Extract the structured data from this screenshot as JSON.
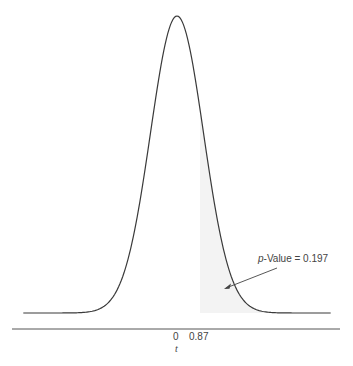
{
  "chart_data": {
    "type": "area",
    "title": "",
    "xlabel": "t",
    "ylabel": "",
    "distribution": "t (symmetric, bell-shaped density)",
    "x_ticks": [
      {
        "value": 0,
        "label": "0"
      },
      {
        "value": 0.87,
        "label": "0.87"
      }
    ],
    "shaded_region": {
      "from": 0.87,
      "to": "inf",
      "tail": "right"
    },
    "annotation": {
      "prefix": "p",
      "text": "-Value = 0.197",
      "p_value": 0.197
    },
    "xlim": [
      -5.8,
      5.8
    ],
    "grid": false,
    "legend": null
  },
  "labels": {
    "tick_0": "0",
    "tick_087": "0.87",
    "axis_title": "t",
    "annot_p": "p",
    "annot_rest": "-Value = 0.197"
  },
  "colors": {
    "curve": "#3a3a3a",
    "shade": "#f3f3f3",
    "axis": "#555555",
    "text": "#444444"
  }
}
